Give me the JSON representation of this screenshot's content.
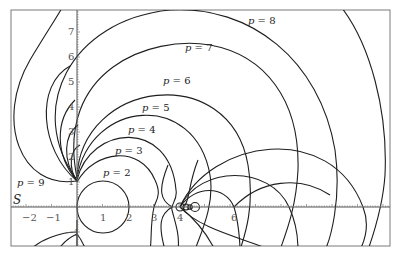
{
  "chart_data": {
    "type": "line",
    "title": "",
    "xlabel": "",
    "ylabel": "",
    "axis_name": "S",
    "xlim": [
      -2.5,
      12.4
    ],
    "ylim": [
      -1.6,
      7.9
    ],
    "grid": false,
    "x_ticks": [
      -2,
      -1,
      1,
      2,
      3,
      4,
      6
    ],
    "y_ticks": [
      -1,
      1,
      2,
      3,
      4,
      5,
      6,
      7
    ],
    "series": [
      {
        "name": "p = 2",
        "label_pos": [
          1.05,
          1.35
        ]
      },
      {
        "name": "p = 3",
        "label_pos": [
          1.55,
          2.2
        ]
      },
      {
        "name": "p = 4",
        "label_pos": [
          2.05,
          3.05
        ]
      },
      {
        "name": "p = 5",
        "label_pos": [
          2.6,
          3.9
        ]
      },
      {
        "name": "p = 6",
        "label_pos": [
          3.4,
          5.0
        ]
      },
      {
        "name": "p = 7",
        "label_pos": [
          4.2,
          6.35
        ]
      },
      {
        "name": "p = 8",
        "label_pos": [
          6.7,
          7.45
        ]
      },
      {
        "name": "p = 9",
        "label_pos": [
          -2.35,
          0.95
        ]
      }
    ],
    "notable_points": {
      "upper_pivot": [
        0,
        1
      ],
      "lower_pivot": [
        0,
        -1
      ],
      "cluster_on_axis": [
        4.2,
        0
      ],
      "axis_crossings_right": [
        6.2,
        8.3,
        11.2
      ]
    }
  },
  "labels": {
    "axis_name": "S",
    "p2": "p = 2",
    "p3": "p = 3",
    "p4": "p = 4",
    "p5": "p = 5",
    "p6": "p = 6",
    "p7": "p = 7",
    "p8": "p = 8",
    "p9": "p = 9"
  },
  "ticks": {
    "xm2": "−2",
    "xm1": "−1",
    "x1": "1",
    "x2": "2",
    "x3": "3",
    "x4": "4",
    "x6": "6",
    "ym1": "−1",
    "y1": "1",
    "y2": "2",
    "y3": "3",
    "y4": "4",
    "y5": "5",
    "y6": "6",
    "y7": "7"
  }
}
